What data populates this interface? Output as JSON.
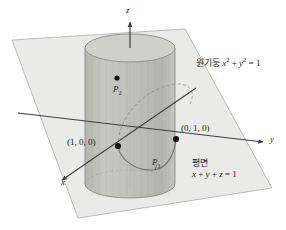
{
  "figure": {
    "background_color": "#ffffff",
    "axes": [
      {
        "name": "z-axis",
        "label": "z"
      },
      {
        "name": "y-axis",
        "label": "y"
      },
      {
        "name": "x-axis",
        "label": "x"
      }
    ],
    "axis_labels": {
      "z": "z",
      "y": "y",
      "x": "x"
    },
    "points": [
      {
        "name": "point-1-0-0",
        "label": "(1, 0, 0)"
      },
      {
        "name": "point-0-1-0",
        "label": "(0, 1, 0)"
      },
      {
        "name": "point-P1",
        "label": "P",
        "sub": "1"
      },
      {
        "name": "point-P2",
        "label": "P",
        "sub": "2"
      }
    ],
    "point_labels": {
      "p100": "(1, 0, 0)",
      "p010": "(0, 1, 0)",
      "P1_base": "P",
      "P1_sub": "1",
      "P2_base": "P",
      "P2_sub": "2"
    },
    "cylinder_label": {
      "keyword": "원기둥",
      "var_x": "x",
      "exp_x": "2",
      "plus": "+",
      "var_y": "y",
      "exp_y": "2",
      "equals": "=",
      "value": "1"
    },
    "plane_label": {
      "keyword": "평면",
      "equation_x": "x",
      "op1": "+",
      "equation_y": "y",
      "op2": "+",
      "equation_z": "z",
      "equals": "=",
      "value": "1"
    },
    "colors": {
      "plane_fill": "#e9e9e7",
      "plane_stroke": "#b9b9b6",
      "cylinder_side": "#bdbdb8",
      "cylinder_top": "#cfcfca",
      "cylinder_stroke": "#8f8f8a",
      "axis_stroke": "#4a4a4a",
      "dot_fill": "#1b1b1b",
      "intersection_stroke": "#6e6e6a",
      "text": "#1b1b1b"
    },
    "geometry": {
      "cylinder_left_x": 85,
      "cylinder_right_x": 176,
      "cylinder_top_y": 48,
      "cylinder_bottom_y": 184,
      "ellipse_rx": 45,
      "ellipse_ry": 14,
      "plane_corners": "12,40 185,29 272,188 78,218"
    }
  }
}
